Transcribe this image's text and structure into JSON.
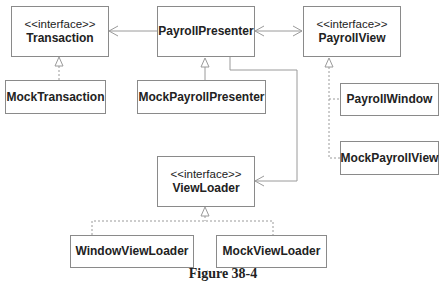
{
  "diagram": {
    "type": "uml-class-diagram",
    "caption": "Figure 38-4",
    "colors": {
      "line": "#9a9a9a",
      "border": "#8a8a8a",
      "text": "#222222"
    },
    "classes": [
      {
        "id": "transaction",
        "stereotype": "<<interface>>",
        "name": "Transaction"
      },
      {
        "id": "payroll-presenter",
        "stereotype": "",
        "name": "PayrollPresenter"
      },
      {
        "id": "payroll-view",
        "stereotype": "<<interface>>",
        "name": "PayrollView"
      },
      {
        "id": "mock-transaction",
        "stereotype": "",
        "name": "MockTransaction"
      },
      {
        "id": "mock-payroll-presenter",
        "stereotype": "",
        "name": "MockPayrollPresenter"
      },
      {
        "id": "payroll-window",
        "stereotype": "",
        "name": "PayrollWindow"
      },
      {
        "id": "mock-payroll-view",
        "stereotype": "",
        "name": "MockPayrollView"
      },
      {
        "id": "view-loader",
        "stereotype": "<<interface>>",
        "name": "ViewLoader"
      },
      {
        "id": "window-view-loader",
        "stereotype": "",
        "name": "WindowViewLoader"
      },
      {
        "id": "mock-view-loader",
        "stereotype": "",
        "name": "MockViewLoader"
      }
    ],
    "relations": [
      {
        "from": "PayrollPresenter",
        "to": "Transaction",
        "kind": "association",
        "arrow": "open"
      },
      {
        "from": "PayrollPresenter",
        "to": "PayrollView",
        "kind": "association",
        "arrow": "bidirectional-open"
      },
      {
        "from": "PayrollPresenter",
        "to": "ViewLoader",
        "kind": "association",
        "arrow": "open"
      },
      {
        "from": "MockTransaction",
        "to": "Transaction",
        "kind": "realization"
      },
      {
        "from": "MockPayrollPresenter",
        "to": "PayrollPresenter",
        "kind": "inheritance"
      },
      {
        "from": "PayrollWindow",
        "to": "PayrollView",
        "kind": "realization"
      },
      {
        "from": "MockPayrollView",
        "to": "PayrollView",
        "kind": "realization"
      },
      {
        "from": "WindowViewLoader",
        "to": "ViewLoader",
        "kind": "realization"
      },
      {
        "from": "MockViewLoader",
        "to": "ViewLoader",
        "kind": "realization"
      }
    ]
  }
}
